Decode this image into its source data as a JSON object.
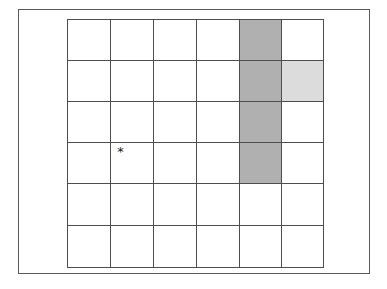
{
  "figure": {
    "title": "",
    "background_color": "#ffffff",
    "frame": {
      "name": "outer-frame",
      "border_color": "#5a5a5a",
      "fill_color": "#ffffff"
    }
  },
  "grid": {
    "rows": 6,
    "columns": 6,
    "line_color": "#4d4d4d",
    "cell_fill_default": "#ffffff",
    "fill_colors": {
      "dark": "#b0b0b0",
      "light": "#dcdcdc",
      "none": "#ffffff"
    },
    "cells": [
      [
        {
          "fill": "none",
          "marker": ""
        },
        {
          "fill": "none",
          "marker": ""
        },
        {
          "fill": "none",
          "marker": ""
        },
        {
          "fill": "none",
          "marker": ""
        },
        {
          "fill": "dark",
          "marker": ""
        },
        {
          "fill": "none",
          "marker": ""
        }
      ],
      [
        {
          "fill": "none",
          "marker": ""
        },
        {
          "fill": "none",
          "marker": ""
        },
        {
          "fill": "none",
          "marker": ""
        },
        {
          "fill": "none",
          "marker": ""
        },
        {
          "fill": "dark",
          "marker": ""
        },
        {
          "fill": "light",
          "marker": ""
        }
      ],
      [
        {
          "fill": "none",
          "marker": ""
        },
        {
          "fill": "none",
          "marker": ""
        },
        {
          "fill": "none",
          "marker": ""
        },
        {
          "fill": "none",
          "marker": ""
        },
        {
          "fill": "dark",
          "marker": ""
        },
        {
          "fill": "none",
          "marker": ""
        }
      ],
      [
        {
          "fill": "none",
          "marker": ""
        },
        {
          "fill": "none",
          "marker": "*"
        },
        {
          "fill": "none",
          "marker": ""
        },
        {
          "fill": "none",
          "marker": ""
        },
        {
          "fill": "dark",
          "marker": ""
        },
        {
          "fill": "none",
          "marker": ""
        }
      ],
      [
        {
          "fill": "none",
          "marker": ""
        },
        {
          "fill": "none",
          "marker": ""
        },
        {
          "fill": "none",
          "marker": ""
        },
        {
          "fill": "none",
          "marker": ""
        },
        {
          "fill": "none",
          "marker": ""
        },
        {
          "fill": "none",
          "marker": ""
        }
      ],
      [
        {
          "fill": "none",
          "marker": ""
        },
        {
          "fill": "none",
          "marker": ""
        },
        {
          "fill": "none",
          "marker": ""
        },
        {
          "fill": "none",
          "marker": ""
        },
        {
          "fill": "none",
          "marker": ""
        },
        {
          "fill": "none",
          "marker": ""
        }
      ]
    ]
  },
  "chart_data": {
    "type": "heatmap",
    "title": "",
    "xlabel": "",
    "ylabel": "",
    "categories_x": [
      "1",
      "2",
      "3",
      "4",
      "5",
      "6"
    ],
    "categories_y": [
      "1",
      "2",
      "3",
      "4",
      "5",
      "6"
    ],
    "legend": [],
    "grid": true,
    "values": [
      [
        0,
        0,
        0,
        0,
        2,
        0
      ],
      [
        0,
        0,
        0,
        0,
        2,
        1
      ],
      [
        0,
        0,
        0,
        0,
        2,
        0
      ],
      [
        0,
        0,
        0,
        0,
        2,
        0
      ],
      [
        0,
        0,
        0,
        0,
        0,
        0
      ],
      [
        0,
        0,
        0,
        0,
        0,
        0
      ]
    ],
    "value_legend": {
      "0": "unshaded",
      "1": "light shaded",
      "2": "dark shaded"
    },
    "annotations": [
      {
        "label": "*",
        "row": 4,
        "column": 2
      }
    ]
  }
}
